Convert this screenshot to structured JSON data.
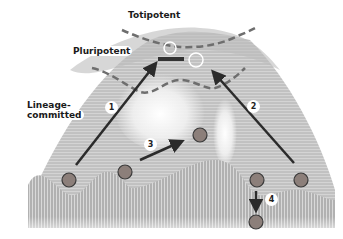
{
  "diagram": {
    "labels": {
      "totipotent": "Totipotent",
      "pluripotent": "Pluripotent",
      "lineage_committed_line1": "Lineage-",
      "lineage_committed_line2": "committed"
    },
    "steps": [
      {
        "id": "1",
        "label": "1",
        "description": "reprogramming arrow from left valley cell up to pluripotent bar"
      },
      {
        "id": "2",
        "label": "2",
        "description": "reprogramming arrow from right valley cell up to pluripotent state"
      },
      {
        "id": "3",
        "label": "3",
        "description": "transdifferentiation arrow between valley cells"
      },
      {
        "id": "4",
        "label": "4",
        "description": "downward arrow to further committed cell"
      }
    ],
    "colors": {
      "cell_fill": "#8c7f7a",
      "cell_stroke": "#3a3a3a",
      "arrow": "#2b2b2b",
      "dashed_boundary": "#6e6e6e",
      "landscape": "#bdbdbd",
      "background": "#ffffff"
    },
    "cells": [
      {
        "name": "cell-left-valley",
        "cx": 69,
        "cy": 180
      },
      {
        "name": "cell-mid-valley",
        "cx": 125,
        "cy": 172
      },
      {
        "name": "cell-ridge-top",
        "cx": 200,
        "cy": 135
      },
      {
        "name": "cell-right-valley-a",
        "cx": 257,
        "cy": 180
      },
      {
        "name": "cell-right-valley-b",
        "cx": 301,
        "cy": 180
      },
      {
        "name": "cell-bottom",
        "cx": 256,
        "cy": 222
      }
    ]
  }
}
